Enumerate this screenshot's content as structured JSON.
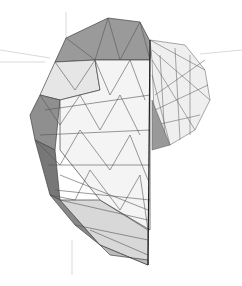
{
  "scene": {
    "description": "3D triangulated wireframe mesh of a curved shell surface with axis lines",
    "background": "#ffffff",
    "colors": {
      "edge": "#444444",
      "light": "#f2f2f2",
      "mid": "#c8c8c8",
      "dark": "#8a8a8a",
      "darker": "#6a6a6a",
      "axis": "#cccccc"
    }
  }
}
